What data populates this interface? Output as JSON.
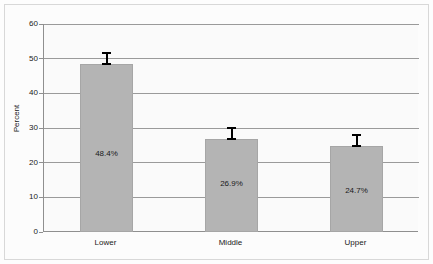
{
  "chart_data": {
    "type": "bar",
    "title": "",
    "xlabel": "",
    "ylabel": "Percent",
    "categories": [
      "Lower",
      "Middle",
      "Upper"
    ],
    "values": [
      48.4,
      26.9,
      24.7
    ],
    "value_labels": [
      "48.4%",
      "26.9%",
      "24.7%"
    ],
    "ylim": [
      0,
      60
    ],
    "yticks": [
      0,
      10,
      20,
      30,
      40,
      50,
      60
    ],
    "ytick_labels": [
      "0",
      "10",
      "20",
      "30",
      "40",
      "50",
      "60"
    ],
    "grid": true,
    "legend": "none",
    "error_bars": true,
    "series": [
      {
        "name": "Percent",
        "values": [
          48.4,
          26.9,
          24.7
        ]
      }
    ],
    "colors": {
      "bar_fill": "#b4b4b4",
      "bar_edge": "#a6a6a6",
      "gridline": "#9a9a9a",
      "axis": "#8f8f8f",
      "text": "#1a1a1a",
      "plot_background": "#fafafa",
      "figure_background": "#fcfcfc",
      "error_bar": "#000000"
    }
  }
}
